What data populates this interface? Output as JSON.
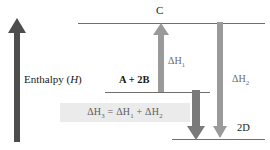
{
  "diagram": {
    "title_axis_label": "Enthalpy (H)",
    "axis_label_plain": "Enthalpy (",
    "axis_label_italic": "H",
    "axis_label_close": ")",
    "levels": [
      {
        "id": "level-c",
        "label": "C"
      },
      {
        "id": "level-a-2b",
        "label": "A + 2B"
      },
      {
        "id": "level-2d",
        "label": "2D"
      }
    ],
    "arrows": [
      {
        "id": "arrow-enthalpy-axis",
        "label": "",
        "direction": "up",
        "color": "#4d4d4d"
      },
      {
        "id": "arrow-delta-h1",
        "label": "ΔH",
        "sub": "1",
        "direction": "up",
        "color": "#9a9a9a"
      },
      {
        "id": "arrow-delta-h3",
        "label": "",
        "sub": "",
        "direction": "down",
        "color": "#7a7a7a"
      },
      {
        "id": "arrow-delta-h2",
        "label": "ΔH",
        "sub": "2",
        "direction": "down",
        "color": "#9a9a9a"
      }
    ],
    "delta_h1_label": "ΔH",
    "delta_h1_sub": "1",
    "delta_h2_label": "ΔH",
    "delta_h2_sub": "2",
    "formula": {
      "lhs": "ΔH",
      "lhs_sub": "3",
      "eq": " = ",
      "t1": "ΔH",
      "t1_sub": "1",
      "plus": " + ",
      "t2": "ΔH",
      "t2_sub": "2"
    },
    "colors": {
      "line": "#6e6e6e",
      "arrow_light": "#9a9a9a",
      "arrow_dark": "#4d4d4d",
      "arrow_mid": "#7a7a7a",
      "formula_bg": "#ebebeb",
      "text": "#1a1a1a",
      "text_grey": "#6b6b6b"
    }
  }
}
